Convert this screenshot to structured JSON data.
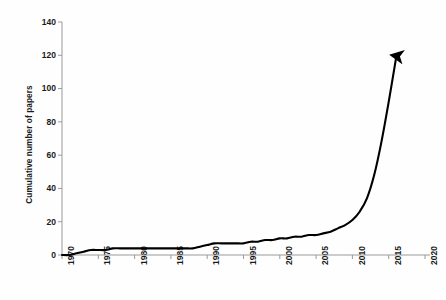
{
  "chart_data": {
    "type": "line",
    "title": "",
    "xlabel": "",
    "ylabel": "Cumulative number of papers",
    "xlim": [
      1970,
      2020
    ],
    "ylim": [
      0,
      140
    ],
    "grid": false,
    "legend": null,
    "annotations": [
      "arrowhead at end of line pointing up"
    ],
    "y_ticks": [
      0,
      20,
      40,
      60,
      80,
      100,
      120,
      140
    ],
    "x_ticks": [
      1970,
      1975,
      1980,
      1985,
      1990,
      1995,
      2000,
      2005,
      2010,
      2015,
      2020
    ],
    "series": [
      {
        "name": "Cumulative number of papers",
        "color": "#000000",
        "x": [
          1970,
          1971,
          1972,
          1973,
          1974,
          1975,
          1976,
          1977,
          1978,
          1979,
          1980,
          1981,
          1982,
          1983,
          1984,
          1985,
          1986,
          1987,
          1988,
          1989,
          1990,
          1991,
          1992,
          1993,
          1994,
          1995,
          1996,
          1997,
          1998,
          1999,
          2000,
          2001,
          2002,
          2003,
          2004,
          2005,
          2006,
          2007,
          2008,
          2009,
          2010,
          2011,
          2012,
          2013,
          2014,
          2015,
          2016
        ],
        "values": [
          0,
          0,
          1,
          2,
          3,
          3,
          3,
          4,
          4,
          4,
          4,
          4,
          4,
          4,
          4,
          4,
          4,
          4,
          4,
          5,
          6,
          7,
          7,
          7,
          7,
          7,
          8,
          8,
          9,
          9,
          10,
          10,
          11,
          11,
          12,
          12,
          13,
          14,
          16,
          18,
          21,
          26,
          34,
          48,
          68,
          92,
          118
        ]
      }
    ]
  },
  "y_tick_labels": [
    "140",
    "120",
    "100",
    "80",
    "60",
    "40",
    "20",
    "0"
  ],
  "x_tick_labels": [
    "1970",
    "1975",
    "1980",
    "1985",
    "1990",
    "1995",
    "2000",
    "2005",
    "2010",
    "2015",
    "2020"
  ],
  "axis": {
    "y_title": "Cumulative number of papers"
  },
  "colors": {
    "line": "#000000",
    "axis": "#9a9a9a",
    "text": "#1a1a1a",
    "background": "#fefefe"
  }
}
